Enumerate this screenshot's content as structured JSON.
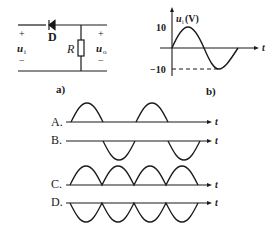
{
  "circuit_a": {
    "caption": "a)",
    "diode_label": "D",
    "resistor_label": "R",
    "input_label": "u",
    "input_sub": "i",
    "output_label": "u",
    "output_sub": "o",
    "plus": "+",
    "minus": "−"
  },
  "graph_b": {
    "caption": "b)",
    "y_label": "u",
    "y_label_sub": "i",
    "y_unit": "(V)",
    "y_max": "10",
    "y_min": "−10",
    "x_label": "t"
  },
  "options": [
    {
      "label": "A.",
      "axis": "t",
      "shape": "positive half-wave"
    },
    {
      "label": "B.",
      "axis": "t",
      "shape": "negative half-wave"
    },
    {
      "label": "C.",
      "axis": "t",
      "shape": "positive full-wave"
    },
    {
      "label": "D.",
      "axis": "t",
      "shape": "negative full-wave"
    }
  ],
  "colors": {
    "ink": "#1a1a1a"
  }
}
